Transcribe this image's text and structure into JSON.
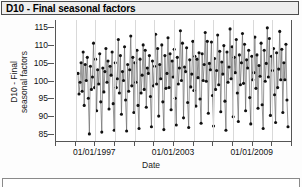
{
  "window": {
    "title": "D10 - Final seasonal factors"
  },
  "labels": {
    "y_axis_line1": "D10 - Final",
    "y_axis_line2": "seasonal factors",
    "x_axis": "Date"
  },
  "chart_data": {
    "type": "line",
    "title": "D10 - Final seasonal factors",
    "xlabel": "Date",
    "ylabel": "D10 - Final seasonal factors",
    "ylim": [
      83,
      117
    ],
    "yticks": [
      85,
      90,
      95,
      100,
      105,
      110,
      115
    ],
    "xticks_major": [
      "01/01/1997",
      "01/01/2003",
      "01/01/2009"
    ],
    "xtick_count": 13,
    "grid": "vertical-only",
    "legend": "none",
    "marker": "filled-circle",
    "series": [
      {
        "name": "D10 - Final seasonal factors",
        "x_start": "01/01/1996",
        "x_end": "01/01/2012",
        "frequency": "monthly",
        "values": [
          102.0,
          96.2,
          99.5,
          105.0,
          97.0,
          108.0,
          93.0,
          104.5,
          100.0,
          106.5,
          95.0,
          85.0,
          104.0,
          97.5,
          101.0,
          110.5,
          98.0,
          106.0,
          91.5,
          103.0,
          99.0,
          107.5,
          94.0,
          85.5,
          103.5,
          96.8,
          102.5,
          109.0,
          99.5,
          105.5,
          92.0,
          104.0,
          101.5,
          108.0,
          93.5,
          86.0,
          105.0,
          98.0,
          100.5,
          111.5,
          96.5,
          107.0,
          90.5,
          102.5,
          100.0,
          109.5,
          94.5,
          85.8,
          104.5,
          97.0,
          103.0,
          112.5,
          98.5,
          106.5,
          91.0,
          105.0,
          99.5,
          108.5,
          93.0,
          86.5,
          106.0,
          96.5,
          101.5,
          110.0,
          97.5,
          108.5,
          92.5,
          103.5,
          102.0,
          107.0,
          95.5,
          87.0,
          105.5,
          98.5,
          104.0,
          113.0,
          99.0,
          109.0,
          90.0,
          104.5,
          100.5,
          110.0,
          94.0,
          86.2,
          107.0,
          97.8,
          102.0,
          112.0,
          98.0,
          107.5,
          91.8,
          105.5,
          101.0,
          108.8,
          95.0,
          87.5,
          106.5,
          99.0,
          103.5,
          114.0,
          100.0,
          110.5,
          89.5,
          103.8,
          102.5,
          109.2,
          93.8,
          86.8,
          105.8,
          98.2,
          101.8,
          111.0,
          97.2,
          106.8,
          92.8,
          106.0,
          100.8,
          107.8,
          94.8,
          88.0,
          107.5,
          100.0,
          104.5,
          113.5,
          99.8,
          111.0,
          90.8,
          104.8,
          103.0,
          110.8,
          95.8,
          87.2,
          106.2,
          97.5,
          102.8,
          112.8,
          98.8,
          108.2,
          91.2,
          105.2,
          101.8,
          109.8,
          94.2,
          86.0,
          108.0,
          99.5,
          103.8,
          114.5,
          100.5,
          109.5,
          89.8,
          106.5,
          102.2,
          111.5,
          96.5,
          88.5,
          107.2,
          98.8,
          105.0,
          113.2,
          99.2,
          110.2,
          91.5,
          105.8,
          103.5,
          108.5,
          95.2,
          87.8,
          106.8,
          100.2,
          102.2,
          112.2,
          97.8,
          107.2,
          92.2,
          104.2,
          101.2,
          110.5,
          93.2,
          86.5,
          108.5,
          99.8,
          104.8,
          114.8,
          101.0,
          111.8,
          90.2,
          106.8,
          102.8,
          109.0,
          96.0,
          88.2,
          107.8,
          98.0,
          103.2,
          113.8,
          100.2,
          108.8,
          91.0,
          105.0,
          100.2,
          110.2,
          94.5,
          87.0
        ]
      }
    ]
  }
}
